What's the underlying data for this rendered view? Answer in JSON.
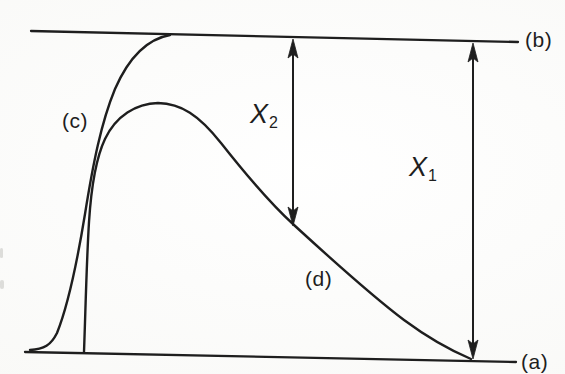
{
  "figure": {
    "colors": {
      "ink": "#1e1e1e",
      "paper": "#fcfcfa"
    },
    "labels": {
      "line_top": "(b)",
      "line_bottom": "(a)",
      "curve_saturating": "(c)",
      "curve_peaked": "(d)"
    },
    "annotations": {
      "x2": {
        "base": "X",
        "sub": "2"
      },
      "x1": {
        "base": "X",
        "sub": "1"
      }
    },
    "icons": {
      "x2_arrow": "double-headed-vertical-arrow",
      "x1_arrow": "double-headed-vertical-arrow"
    }
  }
}
